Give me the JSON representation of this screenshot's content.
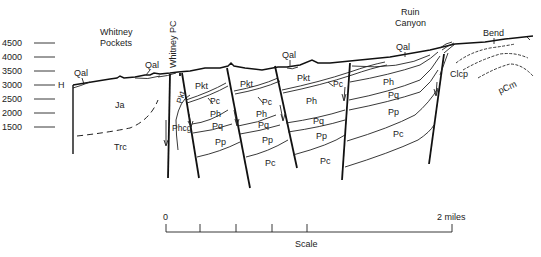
{
  "elevation_axis": {
    "ticks": [
      "4500",
      "4000",
      "3500",
      "3000",
      "2500",
      "2000",
      "1500"
    ],
    "marker": "H"
  },
  "places": {
    "whitney_pockets": [
      "Whitney",
      "Pockets"
    ],
    "whitney_pc": "Whitney PC",
    "ruin_canyon": [
      "Ruin",
      "Canyon"
    ],
    "bend": "Bend"
  },
  "units": {
    "qal": "Qal",
    "ja": "Ja",
    "trc": "Trc",
    "pkt": "Pkt",
    "pc": "Pc",
    "ph": "Ph",
    "pq": "Pq",
    "pp": "Pp",
    "phcg": "Phcg",
    "clcp": "Clcp",
    "pcm": "pCm"
  },
  "scale": {
    "start": "0",
    "end": "2 miles",
    "label": "Scale"
  }
}
